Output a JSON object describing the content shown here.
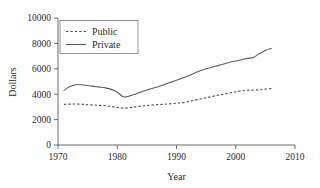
{
  "chart_data": {
    "type": "line",
    "title": "",
    "xlabel": "Year",
    "ylabel": "Dollars",
    "xlim": [
      1970,
      2010
    ],
    "ylim": [
      0,
      10000
    ],
    "xticks": [
      1970,
      1980,
      1990,
      2000,
      2010
    ],
    "xtick_labels": [
      "1970",
      "1980",
      "1990",
      "2000",
      "2010"
    ],
    "yticks": [
      0,
      2000,
      4000,
      6000,
      8000,
      10000
    ],
    "ytick_labels": [
      "0",
      "2000",
      "4000",
      "6000",
      "8000",
      "10000"
    ],
    "grid": false,
    "legend_position": "upper left",
    "x": [
      1971,
      1972,
      1973,
      1974,
      1975,
      1976,
      1977,
      1978,
      1979,
      1980,
      1981,
      1982,
      1983,
      1984,
      1985,
      1986,
      1987,
      1988,
      1989,
      1990,
      1991,
      1992,
      1993,
      1994,
      1995,
      1996,
      1997,
      1998,
      1999,
      2000,
      2001,
      2002,
      2003,
      2004,
      2005,
      2006
    ],
    "series": [
      {
        "name": "Public",
        "style": "dashed",
        "color": "#4a4a4a",
        "values": [
          3200,
          3220,
          3230,
          3210,
          3170,
          3150,
          3120,
          3090,
          3030,
          2950,
          2900,
          2930,
          3000,
          3060,
          3110,
          3150,
          3180,
          3210,
          3250,
          3290,
          3330,
          3420,
          3520,
          3620,
          3720,
          3820,
          3920,
          4010,
          4100,
          4190,
          4260,
          4310,
          4330,
          4350,
          4400,
          4450
        ]
      },
      {
        "name": "Private",
        "style": "solid",
        "color": "#5d5d5d",
        "values": [
          4300,
          4600,
          4750,
          4740,
          4680,
          4620,
          4560,
          4500,
          4380,
          4150,
          3800,
          3850,
          4000,
          4180,
          4330,
          4470,
          4600,
          4760,
          4930,
          5100,
          5270,
          5450,
          5650,
          5850,
          6000,
          6130,
          6250,
          6380,
          6520,
          6620,
          6720,
          6820,
          6900,
          7200,
          7450,
          7600
        ]
      }
    ]
  },
  "legend": {
    "entries": [
      {
        "label": "Public",
        "swatch": "dashed-line-swatch"
      },
      {
        "label": "Private",
        "swatch": "solid-line-swatch"
      }
    ]
  }
}
